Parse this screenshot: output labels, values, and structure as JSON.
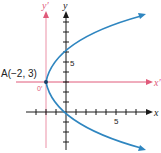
{
  "diagram": {
    "type": "parabola-translation",
    "colors": {
      "axes": "#1a1a1a",
      "translated_axes": "#e05a7a",
      "translated_axes_line": "#f2b6c4",
      "curve": "#2f86c0",
      "text": "#222222"
    },
    "axes": {
      "x_label": "x",
      "y_label": "y",
      "tick_label_x": "5",
      "tick_label_y": "5"
    },
    "translated_axes": {
      "x_label": "x′",
      "y_label": "y′",
      "origin_label": "0′"
    },
    "point": {
      "label": "A(−2, 3)",
      "x": -2,
      "y": 3
    },
    "curve": {
      "equation": "(y − 3)² = 4.5(x + 2)",
      "vertex": [
        -2,
        3
      ],
      "opens": "right"
    }
  }
}
